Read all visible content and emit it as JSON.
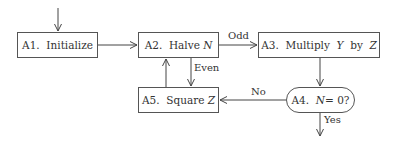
{
  "diagram": {
    "type": "flowchart",
    "nodes": [
      {
        "id": "A1",
        "step": "A1.",
        "label": "Initialize",
        "var": ""
      },
      {
        "id": "A2",
        "step": "A2.",
        "label": "Halve",
        "var": "N"
      },
      {
        "id": "A3",
        "step": "A3.",
        "label": "Multiply",
        "var1": "Y",
        "by": "by",
        "var2": "Z"
      },
      {
        "id": "A4",
        "step": "A4.",
        "var": "N",
        "eq": "= 0?",
        "shape": "rounded"
      },
      {
        "id": "A5",
        "step": "A5.",
        "label": "Square",
        "var": "Z"
      }
    ],
    "edges": [
      {
        "from": "start",
        "to": "A1",
        "label": ""
      },
      {
        "from": "A1",
        "to": "A2",
        "label": ""
      },
      {
        "from": "A2",
        "to": "A3",
        "label": "Odd"
      },
      {
        "from": "A2",
        "to": "A5",
        "label": "Even"
      },
      {
        "from": "A5",
        "to": "A2",
        "label": ""
      },
      {
        "from": "A3",
        "to": "A4",
        "label": ""
      },
      {
        "from": "A4",
        "to": "A5",
        "label": "No"
      },
      {
        "from": "A4",
        "to": "end",
        "label": "Yes"
      }
    ]
  }
}
